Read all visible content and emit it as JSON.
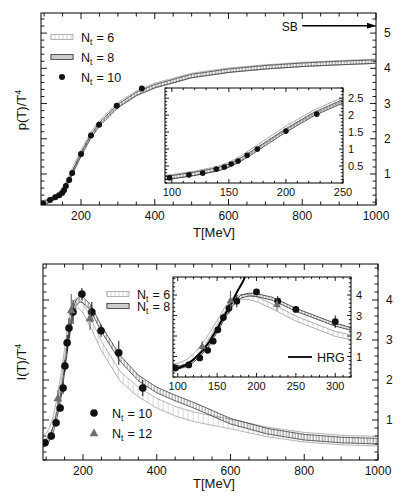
{
  "figure": {
    "panels": [
      "pressure",
      "interaction-measure"
    ]
  },
  "chart_data": [
    {
      "id": "pressure_main",
      "type": "line",
      "title": "",
      "xlabel": "T[MeV]",
      "ylabel": "p(T)/T^4",
      "ylabel_parts": {
        "base": "p(T)/T",
        "sup": "4"
      },
      "xlim": [
        91.5,
        1000
      ],
      "ylim": [
        0.12,
        5.57
      ],
      "xticks": [
        200,
        400,
        600,
        800,
        1000
      ],
      "yticks": [
        1,
        2,
        3,
        4,
        5
      ],
      "xminor": 50,
      "yminor": 0.2,
      "ytick_side": "right",
      "grid": false,
      "legend_position": "upper left",
      "legend": [
        {
          "label": "N_t = 6",
          "label_parts": {
            "base": "N",
            "sub": "t",
            "rest": "= 6"
          }
        },
        {
          "label": "N_t = 8",
          "label_parts": {
            "base": "N",
            "sub": "t",
            "rest": "= 8"
          }
        },
        {
          "label": "N_t = 10",
          "label_parts": {
            "base": "N",
            "sub": "t",
            "rest": "= 10"
          }
        }
      ],
      "annotations": [
        {
          "text": "SB",
          "y": 5.21,
          "text_x": 766,
          "arrow_from_x": 800,
          "arrow_to_x": 1000
        }
      ],
      "series": [
        {
          "name": "N_t = 6",
          "kind": "band",
          "style": "nt6",
          "x": [
            92,
            100,
            120,
            140,
            150,
            160,
            170,
            180,
            190,
            200,
            225,
            250,
            300,
            350,
            400,
            500,
            600,
            700,
            800,
            900,
            1000
          ],
          "y": [
            0.16,
            0.19,
            0.29,
            0.43,
            0.55,
            0.73,
            0.95,
            1.18,
            1.4,
            1.62,
            2.1,
            2.47,
            2.97,
            3.3,
            3.52,
            3.8,
            3.95,
            4.04,
            4.11,
            4.16,
            4.2
          ],
          "err": 0.06
        },
        {
          "name": "N_t = 8",
          "kind": "band",
          "style": "nt8",
          "x": [
            92,
            100,
            120,
            140,
            150,
            160,
            170,
            180,
            190,
            200,
            225,
            250,
            300,
            350,
            400,
            500,
            600,
            700,
            800,
            900,
            1000
          ],
          "y": [
            0.15,
            0.17,
            0.27,
            0.4,
            0.51,
            0.68,
            0.89,
            1.11,
            1.33,
            1.55,
            2.04,
            2.41,
            2.93,
            3.27,
            3.49,
            3.78,
            3.93,
            4.03,
            4.1,
            4.15,
            4.19
          ],
          "err": 0.05
        },
        {
          "name": "N_t = 10",
          "kind": "points",
          "marker": "circle",
          "x": [
            97,
            116,
            130,
            141,
            149,
            154,
            159,
            168,
            176,
            200,
            227,
            249,
            297,
            365
          ],
          "y": [
            0.17,
            0.26,
            0.34,
            0.4,
            0.46,
            0.54,
            0.66,
            0.83,
            1.03,
            1.57,
            2.09,
            2.4,
            2.94,
            3.43
          ]
        }
      ]
    },
    {
      "id": "pressure_inset",
      "type": "line",
      "title": "",
      "xlabel": "",
      "ylabel": "",
      "xlim": [
        94,
        250
      ],
      "ylim": [
        0,
        2.8
      ],
      "xticks": [
        100,
        150,
        200,
        250
      ],
      "yticks": [
        0.5,
        1,
        1.5,
        2,
        2.5
      ],
      "xminor": 10,
      "yminor": 0.1,
      "ytick_side": "right",
      "grid": false,
      "series": [
        {
          "name": "N_t = 6",
          "kind": "band",
          "style": "nt6",
          "x": [
            92,
            100,
            120,
            140,
            150,
            160,
            170,
            180,
            190,
            200,
            225,
            250,
            300
          ],
          "y": [
            0.16,
            0.19,
            0.29,
            0.43,
            0.55,
            0.73,
            0.95,
            1.18,
            1.4,
            1.62,
            2.1,
            2.47,
            2.97
          ],
          "err": 0.06
        },
        {
          "name": "N_t = 8",
          "kind": "band",
          "style": "nt8",
          "x": [
            92,
            100,
            120,
            140,
            150,
            160,
            170,
            180,
            190,
            200,
            225,
            250,
            300
          ],
          "y": [
            0.15,
            0.17,
            0.27,
            0.4,
            0.51,
            0.68,
            0.89,
            1.11,
            1.33,
            1.55,
            2.04,
            2.41,
            2.93
          ],
          "err": 0.05
        },
        {
          "name": "N_t = 10",
          "kind": "points",
          "marker": "circle",
          "x": [
            98,
            115,
            127,
            139,
            146,
            152,
            158,
            166,
            175,
            200,
            227
          ],
          "y": [
            0.15,
            0.24,
            0.29,
            0.41,
            0.47,
            0.56,
            0.65,
            0.82,
            1.0,
            1.53,
            2.03
          ]
        }
      ]
    },
    {
      "id": "interaction_main",
      "type": "line",
      "title": "",
      "xlabel": "T[MeV]",
      "ylabel": "I(T)/T^4",
      "ylabel_parts": {
        "base": "I(T)/T",
        "sup": "4"
      },
      "xlim": [
        91.5,
        1000
      ],
      "ylim": [
        0,
        4.9
      ],
      "xticks": [
        200,
        400,
        600,
        800,
        1000
      ],
      "yticks": [
        1,
        2,
        3,
        4
      ],
      "xminor": 50,
      "yminor": 0.2,
      "ytick_side": "right",
      "grid": false,
      "legend_position": "upper center / lower left",
      "legend": [
        {
          "label": "N_t = 6",
          "label_parts": {
            "base": "N",
            "sub": "t",
            "rest": "= 6"
          }
        },
        {
          "label": "N_t = 8",
          "label_parts": {
            "base": "N",
            "sub": "t",
            "rest": "= 8"
          }
        },
        {
          "label": "N_t = 10",
          "label_parts": {
            "base": "N",
            "sub": "t",
            "rest": "= 10"
          }
        },
        {
          "label": "N_t = 12",
          "label_parts": {
            "base": "N",
            "sub": "t",
            "rest": "= 12"
          }
        }
      ],
      "series": [
        {
          "name": "N_t = 6",
          "kind": "band",
          "style": "nt6",
          "x": [
            92,
            100,
            110,
            120,
            130,
            140,
            150,
            160,
            170,
            180,
            190,
            200,
            220,
            250,
            300,
            350,
            400,
            450,
            500,
            600,
            700,
            800,
            900,
            1000
          ],
          "y": [
            0.5,
            0.55,
            0.7,
            1.0,
            1.45,
            2.0,
            2.65,
            3.3,
            3.75,
            3.92,
            3.9,
            3.8,
            3.45,
            2.85,
            2.1,
            1.7,
            1.42,
            1.22,
            1.08,
            0.9,
            0.7,
            0.57,
            0.5,
            0.47
          ],
          "err": 0.12
        },
        {
          "name": "N_t = 8",
          "kind": "band",
          "style": "nt8",
          "x": [
            92,
            100,
            110,
            120,
            130,
            140,
            150,
            160,
            170,
            180,
            190,
            200,
            220,
            250,
            300,
            350,
            400,
            450,
            500,
            600,
            700,
            800,
            900,
            1000
          ],
          "y": [
            0.4,
            0.45,
            0.56,
            0.78,
            1.15,
            1.6,
            2.25,
            2.95,
            3.55,
            3.92,
            4.02,
            4.0,
            3.82,
            3.28,
            2.55,
            2.05,
            1.75,
            1.55,
            1.37,
            0.97,
            0.72,
            0.57,
            0.5,
            0.47
          ],
          "err": 0.07
        },
        {
          "name": "N_t = 10",
          "kind": "points",
          "marker": "circle",
          "x": [
            97,
            114,
            127,
            138,
            146,
            151,
            157,
            162,
            173,
            197,
            224,
            249,
            297,
            362
          ],
          "y": [
            0.43,
            0.6,
            0.93,
            1.3,
            1.8,
            2.35,
            2.93,
            3.3,
            3.7,
            4.15,
            3.7,
            3.23,
            2.68,
            1.8
          ],
          "err": [
            0.1,
            0.1,
            0.1,
            0.1,
            0.15,
            0.15,
            0.2,
            0.25,
            0.3,
            0.15,
            0.25,
            0.15,
            0.3,
            0.2
          ]
        },
        {
          "name": "N_t = 12",
          "kind": "points",
          "marker": "triangle",
          "x": [
            132,
            168,
            219
          ],
          "y": [
            1.55,
            3.75,
            3.55
          ],
          "err": [
            0.2,
            0.4,
            0.3
          ]
        }
      ]
    },
    {
      "id": "interaction_inset",
      "type": "line",
      "title": "",
      "xlabel": "",
      "ylabel": "",
      "xlim": [
        94,
        320
      ],
      "ylim": [
        0,
        4.88
      ],
      "xticks": [
        100,
        150,
        200,
        250,
        300
      ],
      "yticks": [
        1,
        2,
        3,
        4
      ],
      "xminor": 10,
      "yminor": 0.2,
      "ytick_side": "right",
      "grid": false,
      "legend_position": "lower right",
      "legend": [
        {
          "label": "HRG",
          "label_parts": {
            "base": "HRG",
            "sub": "",
            "rest": ""
          }
        }
      ],
      "series": [
        {
          "name": "N_t = 6",
          "kind": "band",
          "style": "nt6",
          "x": [
            92,
            100,
            110,
            120,
            130,
            140,
            150,
            160,
            170,
            180,
            190,
            200,
            220,
            250,
            300,
            350
          ],
          "y": [
            0.5,
            0.55,
            0.7,
            1.0,
            1.45,
            2.0,
            2.65,
            3.3,
            3.75,
            3.92,
            3.9,
            3.8,
            3.45,
            2.85,
            2.1,
            1.7
          ],
          "err": 0.12
        },
        {
          "name": "N_t = 8",
          "kind": "band",
          "style": "nt8",
          "x": [
            92,
            100,
            110,
            120,
            130,
            140,
            150,
            160,
            170,
            180,
            190,
            200,
            220,
            250,
            300,
            350
          ],
          "y": [
            0.4,
            0.45,
            0.56,
            0.78,
            1.15,
            1.6,
            2.25,
            2.95,
            3.55,
            3.92,
            4.02,
            4.0,
            3.82,
            3.28,
            2.55,
            2.05
          ],
          "err": 0.07
        },
        {
          "name": "HRG",
          "kind": "line",
          "x": [
            94,
            100,
            110,
            120,
            132,
            140,
            150,
            160,
            170,
            176,
            182,
            188
          ],
          "y": [
            0.34,
            0.42,
            0.58,
            0.85,
            1.3,
            1.72,
            2.35,
            3.05,
            3.75,
            4.2,
            4.6,
            5.1
          ]
        },
        {
          "name": "N_t = 10",
          "kind": "points",
          "marker": "circle",
          "x": [
            97,
            114,
            128,
            138,
            145,
            151,
            158,
            165,
            175,
            200,
            227,
            250,
            300
          ],
          "y": [
            0.44,
            0.59,
            0.93,
            1.3,
            1.75,
            2.3,
            2.9,
            3.35,
            3.7,
            4.15,
            3.7,
            3.3,
            2.7
          ],
          "err": [
            0.1,
            0.1,
            0.1,
            0.1,
            0.12,
            0.12,
            0.18,
            0.25,
            0.3,
            0.15,
            0.25,
            0.15,
            0.3
          ]
        },
        {
          "name": "N_t = 12",
          "kind": "points",
          "marker": "triangle",
          "x": [
            131,
            167,
            226
          ],
          "y": [
            1.5,
            3.75,
            3.55
          ],
          "err": [
            0.25,
            0.45,
            0.3
          ]
        }
      ]
    }
  ]
}
